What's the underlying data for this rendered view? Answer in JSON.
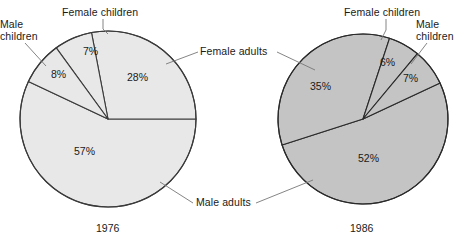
{
  "figure": {
    "type": "two-pie-comparison",
    "background": "#ffffff",
    "text_color": "#1a1a1a"
  },
  "labels": {
    "female_children": "Female children",
    "male_children_line1": "Male",
    "male_children_line2": "children",
    "female_adults": "Female adults",
    "male_adults": "Male adults",
    "male_children_r_line1": "Male",
    "male_children_r_line2": "children",
    "female_children_r": "Female children"
  },
  "charts": [
    {
      "id": "pie-1976",
      "year_label": "1976",
      "fill": "#e8e8e8",
      "stroke": "#3a3a3a",
      "center": [
        108,
        119
      ],
      "radius": 88,
      "slices": [
        {
          "name": "Female adults",
          "pct_label": "28%",
          "value": 28
        },
        {
          "name": "Female children",
          "pct_label": "7%",
          "value": 7
        },
        {
          "name": "Male children",
          "pct_label": "8%",
          "value": 8
        },
        {
          "name": "Male adults",
          "pct_label": "57%",
          "value": 57
        }
      ]
    },
    {
      "id": "pie-1986",
      "year_label": "1986",
      "fill": "#c4c4c4",
      "stroke": "#2a2a2a",
      "center": [
        363,
        119
      ],
      "radius": 85,
      "slices": [
        {
          "name": "Male children",
          "pct_label": "7%",
          "value": 7
        },
        {
          "name": "Female children",
          "pct_label": "6%",
          "value": 6
        },
        {
          "name": "Female adults",
          "pct_label": "35%",
          "value": 35
        },
        {
          "name": "Male adults",
          "pct_label": "52%",
          "value": 52
        }
      ]
    }
  ],
  "chart_data": {
    "type": "pie",
    "title": "",
    "subtitle": "",
    "legend_position": "callout-labels",
    "grid": false,
    "categories": [
      "Female adults",
      "Female children",
      "Male children",
      "Male adults"
    ],
    "series": [
      {
        "name": "1976",
        "values": [
          28,
          7,
          8,
          57
        ]
      },
      {
        "name": "1986",
        "values": [
          35,
          6,
          7,
          52
        ]
      }
    ],
    "annotations": [
      "1976",
      "1986"
    ],
    "units": "percent"
  }
}
